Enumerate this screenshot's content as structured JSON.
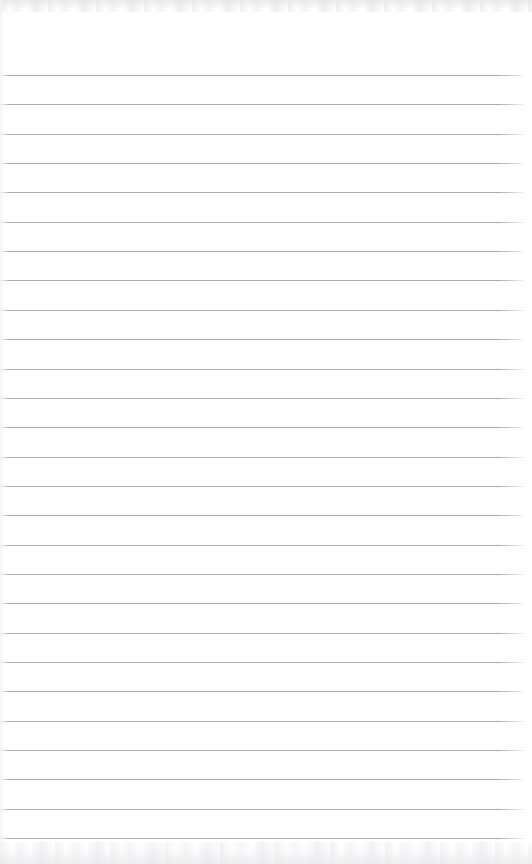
{
  "page": {
    "kind": "ruled-notebook-page",
    "width": 532,
    "height": 864,
    "background_color": "#ffffff",
    "content_text": "",
    "has_written_content": false
  },
  "rules": {
    "count": 27,
    "first_line_y": 75,
    "last_line_y": 838,
    "spacing": 29.35,
    "thickness": 1,
    "color": "#9c9ca1",
    "left_inset": 0,
    "right_inset": 8
  },
  "margins": {
    "top_blank_height": 75,
    "bottom_blank_height": 26,
    "left_edge_shade_width": 4
  },
  "texture": {
    "top_band_height": 12,
    "bottom_band_height": 22,
    "tint_color": "#eceef1"
  }
}
